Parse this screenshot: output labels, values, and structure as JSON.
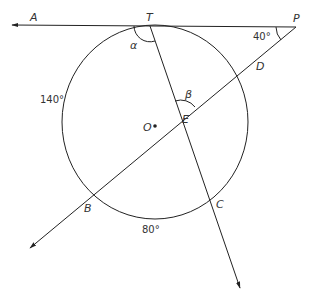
{
  "diagram": {
    "points": {
      "A": "A",
      "T": "T",
      "P": "P",
      "D": "D",
      "E": "E",
      "O": "O",
      "B": "B",
      "C": "C"
    },
    "angles": {
      "alpha": "α",
      "beta": "β",
      "angle_P": "40°"
    },
    "arcs": {
      "arc_left": "140°",
      "arc_bottom": "80°"
    }
  }
}
